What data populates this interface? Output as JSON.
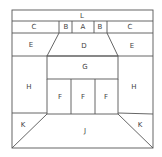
{
  "diagram": {
    "stroke_color": "#555555",
    "background": "#ffffff",
    "regions": [
      {
        "id": "L",
        "label": "L",
        "x": 82,
        "y": 16
      },
      {
        "id": "C-left",
        "label": "C",
        "x": 34,
        "y": 27
      },
      {
        "id": "B-left",
        "label": "B",
        "x": 66,
        "y": 27
      },
      {
        "id": "A",
        "label": "A",
        "x": 83,
        "y": 27
      },
      {
        "id": "B-right",
        "label": "B",
        "x": 100,
        "y": 27
      },
      {
        "id": "C-right",
        "label": "C",
        "x": 130,
        "y": 27
      },
      {
        "id": "E-left",
        "label": "E",
        "x": 31,
        "y": 45
      },
      {
        "id": "D",
        "label": "D",
        "x": 84,
        "y": 46
      },
      {
        "id": "E-right",
        "label": "E",
        "x": 132,
        "y": 46
      },
      {
        "id": "G",
        "label": "G",
        "x": 85,
        "y": 67
      },
      {
        "id": "H-left",
        "label": "H",
        "x": 29,
        "y": 87
      },
      {
        "id": "F-1",
        "label": "F",
        "x": 60,
        "y": 97
      },
      {
        "id": "F-2",
        "label": "F",
        "x": 83,
        "y": 97
      },
      {
        "id": "F-3",
        "label": "F",
        "x": 106,
        "y": 97
      },
      {
        "id": "H-right",
        "label": "H",
        "x": 134,
        "y": 87
      },
      {
        "id": "K-left",
        "label": "K",
        "x": 23,
        "y": 125
      },
      {
        "id": "J",
        "label": "J",
        "x": 85,
        "y": 131
      },
      {
        "id": "K-right",
        "label": "K",
        "x": 140,
        "y": 125
      }
    ]
  }
}
